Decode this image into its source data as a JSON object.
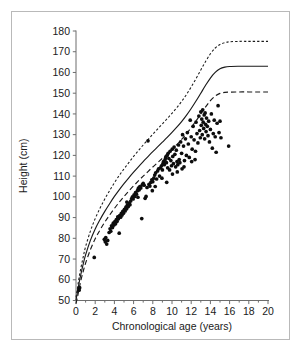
{
  "figure": {
    "border_color": "#b9b9b9",
    "background": "#ffffff"
  },
  "chart_data": {
    "type": "scatter",
    "title": "",
    "subtitle": "",
    "xlabel": "Chronological age (years)",
    "ylabel": "Height (cm)",
    "xlim": [
      0,
      20
    ],
    "ylim": [
      50,
      180
    ],
    "grid": false,
    "legend_position": "none",
    "x_ticks": [
      0,
      2,
      4,
      6,
      8,
      10,
      12,
      14,
      16,
      18,
      20
    ],
    "x_tick_labels": [
      "0",
      "2",
      "4",
      "6",
      "8",
      "10",
      "12",
      "14",
      "16",
      "18",
      "20"
    ],
    "x_minor_ticks": [
      1,
      3,
      5,
      7,
      9,
      11,
      13,
      15,
      17,
      19
    ],
    "y_ticks": [
      50,
      60,
      70,
      80,
      90,
      100,
      110,
      120,
      130,
      140,
      150,
      160,
      170,
      180
    ],
    "y_tick_labels": [
      "50",
      "60",
      "70",
      "80",
      "90",
      "100",
      "110",
      "120",
      "130",
      "140",
      "150",
      "160",
      "170",
      "180"
    ],
    "series": [
      {
        "name": "Upper reference percentile",
        "type": "line",
        "style": "dotted",
        "color": "#1a1a1a",
        "plateau": 175,
        "points": [
          [
            0.0,
            51.5
          ],
          [
            0.15,
            56.0
          ],
          [
            0.3,
            60.5
          ],
          [
            0.5,
            65.5
          ],
          [
            0.75,
            71.0
          ],
          [
            1.0,
            76.0
          ],
          [
            1.5,
            83.5
          ],
          [
            2.0,
            89.5
          ],
          [
            2.5,
            94.5
          ],
          [
            3.0,
            99.0
          ],
          [
            3.5,
            103.0
          ],
          [
            4.0,
            106.8
          ],
          [
            4.5,
            110.3
          ],
          [
            5.0,
            113.5
          ],
          [
            5.5,
            116.5
          ],
          [
            6.0,
            119.5
          ],
          [
            6.5,
            122.3
          ],
          [
            7.0,
            125.0
          ],
          [
            7.5,
            127.6
          ],
          [
            8.0,
            130.2
          ],
          [
            8.5,
            132.7
          ],
          [
            9.0,
            135.2
          ],
          [
            9.5,
            137.7
          ],
          [
            10.0,
            140.3
          ],
          [
            10.5,
            143.0
          ],
          [
            11.0,
            146.0
          ],
          [
            11.5,
            149.3
          ],
          [
            12.0,
            153.0
          ],
          [
            12.5,
            157.0
          ],
          [
            13.0,
            161.2
          ],
          [
            13.5,
            165.3
          ],
          [
            14.0,
            169.0
          ],
          [
            14.5,
            171.8
          ],
          [
            15.0,
            173.5
          ],
          [
            15.5,
            174.4
          ],
          [
            16.0,
            174.8
          ],
          [
            17.0,
            175.0
          ],
          [
            18.0,
            175.0
          ],
          [
            19.0,
            175.0
          ],
          [
            20.0,
            175.0
          ]
        ]
      },
      {
        "name": "Median reference",
        "type": "line",
        "style": "solid",
        "color": "#1a1a1a",
        "plateau": 163,
        "points": [
          [
            0.0,
            50.2
          ],
          [
            0.15,
            54.0
          ],
          [
            0.3,
            58.0
          ],
          [
            0.5,
            62.5
          ],
          [
            0.75,
            67.5
          ],
          [
            1.0,
            72.0
          ],
          [
            1.5,
            79.0
          ],
          [
            2.0,
            84.5
          ],
          [
            2.5,
            89.0
          ],
          [
            3.0,
            93.0
          ],
          [
            3.5,
            96.7
          ],
          [
            4.0,
            100.2
          ],
          [
            4.5,
            103.4
          ],
          [
            5.0,
            106.4
          ],
          [
            5.5,
            109.2
          ],
          [
            6.0,
            111.9
          ],
          [
            6.5,
            114.5
          ],
          [
            7.0,
            117.0
          ],
          [
            7.5,
            119.4
          ],
          [
            8.0,
            121.8
          ],
          [
            8.5,
            124.1
          ],
          [
            9.0,
            126.4
          ],
          [
            9.5,
            128.7
          ],
          [
            10.0,
            131.1
          ],
          [
            10.5,
            133.6
          ],
          [
            11.0,
            136.3
          ],
          [
            11.5,
            139.3
          ],
          [
            12.0,
            142.6
          ],
          [
            12.5,
            146.2
          ],
          [
            13.0,
            150.0
          ],
          [
            13.5,
            153.8
          ],
          [
            14.0,
            157.3
          ],
          [
            14.5,
            160.0
          ],
          [
            15.0,
            161.8
          ],
          [
            15.5,
            162.6
          ],
          [
            16.0,
            162.9
          ],
          [
            17.0,
            163.0
          ],
          [
            18.0,
            163.0
          ],
          [
            19.0,
            163.0
          ],
          [
            20.0,
            163.0
          ]
        ]
      },
      {
        "name": "Lower reference percentile",
        "type": "line",
        "style": "dashed",
        "color": "#1a1a1a",
        "plateau": 150.5,
        "points": [
          [
            0.0,
            48.5
          ],
          [
            0.15,
            51.5
          ],
          [
            0.3,
            55.0
          ],
          [
            0.5,
            59.5
          ],
          [
            0.75,
            64.0
          ],
          [
            1.0,
            68.0
          ],
          [
            1.5,
            74.5
          ],
          [
            2.0,
            79.8
          ],
          [
            2.5,
            84.0
          ],
          [
            3.0,
            87.8
          ],
          [
            3.5,
            91.2
          ],
          [
            4.0,
            94.4
          ],
          [
            4.5,
            97.4
          ],
          [
            5.0,
            100.2
          ],
          [
            5.5,
            102.8
          ],
          [
            6.0,
            105.3
          ],
          [
            6.5,
            107.7
          ],
          [
            7.0,
            110.0
          ],
          [
            7.5,
            112.2
          ],
          [
            8.0,
            114.4
          ],
          [
            8.5,
            116.5
          ],
          [
            9.0,
            118.6
          ],
          [
            9.5,
            120.7
          ],
          [
            10.0,
            122.9
          ],
          [
            10.5,
            125.2
          ],
          [
            11.0,
            127.7
          ],
          [
            11.5,
            130.4
          ],
          [
            12.0,
            133.4
          ],
          [
            12.5,
            136.6
          ],
          [
            13.0,
            140.0
          ],
          [
            13.5,
            143.4
          ],
          [
            14.0,
            146.4
          ],
          [
            14.5,
            148.6
          ],
          [
            15.0,
            149.9
          ],
          [
            15.5,
            150.4
          ],
          [
            16.0,
            150.5
          ],
          [
            17.0,
            150.6
          ],
          [
            18.0,
            150.6
          ],
          [
            19.0,
            150.6
          ],
          [
            20.0,
            150.6
          ]
        ]
      },
      {
        "name": "Patient measurements",
        "type": "scatter",
        "marker": "filled-circle",
        "color": "#0d0d0d",
        "points": [
          [
            0.3,
            55.5
          ],
          [
            0.38,
            56.2
          ],
          [
            0.32,
            55.0
          ],
          [
            1.9,
            70.8
          ],
          [
            2.95,
            79.5
          ],
          [
            3.05,
            78.3
          ],
          [
            3.1,
            80.4
          ],
          [
            3.2,
            77.2
          ],
          [
            3.3,
            79.0
          ],
          [
            3.45,
            82.8
          ],
          [
            3.55,
            84.6
          ],
          [
            3.62,
            83.4
          ],
          [
            3.7,
            86.0
          ],
          [
            3.8,
            85.2
          ],
          [
            3.88,
            87.3
          ],
          [
            3.95,
            86.4
          ],
          [
            4.05,
            88.1
          ],
          [
            4.12,
            87.0
          ],
          [
            4.2,
            89.0
          ],
          [
            4.28,
            88.2
          ],
          [
            4.35,
            90.3
          ],
          [
            4.42,
            89.4
          ],
          [
            4.5,
            82.5
          ],
          [
            4.55,
            91.0
          ],
          [
            4.65,
            90.2
          ],
          [
            4.72,
            92.0
          ],
          [
            4.8,
            91.2
          ],
          [
            4.88,
            93.0
          ],
          [
            4.95,
            92.1
          ],
          [
            5.05,
            94.0
          ],
          [
            5.12,
            93.2
          ],
          [
            5.2,
            95.0
          ],
          [
            5.28,
            94.2
          ],
          [
            5.35,
            96.0
          ],
          [
            5.45,
            95.3
          ],
          [
            5.55,
            97.0
          ],
          [
            5.62,
            96.2
          ],
          [
            5.7,
            98.0
          ],
          [
            5.8,
            99.2
          ],
          [
            5.88,
            100.0
          ],
          [
            5.95,
            99.0
          ],
          [
            6.05,
            101.0
          ],
          [
            6.12,
            100.2
          ],
          [
            6.2,
            102.0
          ],
          [
            6.3,
            101.3
          ],
          [
            6.4,
            103.0
          ],
          [
            6.5,
            104.2
          ],
          [
            6.58,
            103.4
          ],
          [
            6.65,
            105.0
          ],
          [
            6.75,
            104.3
          ],
          [
            6.85,
            89.5
          ],
          [
            6.9,
            105.8
          ],
          [
            7.0,
            106.5
          ],
          [
            7.1,
            105.6
          ],
          [
            7.2,
            99.3
          ],
          [
            7.3,
            100.2
          ],
          [
            7.4,
            104.5
          ],
          [
            7.5,
            127.0
          ],
          [
            7.6,
            106.0
          ],
          [
            7.7,
            105.2
          ],
          [
            7.8,
            107.0
          ],
          [
            7.9,
            108.2
          ],
          [
            8.0,
            107.3
          ],
          [
            8.1,
            109.0
          ],
          [
            8.2,
            110.5
          ],
          [
            8.3,
            111.6
          ],
          [
            8.4,
            108.6
          ],
          [
            8.5,
            112.5
          ],
          [
            8.6,
            113.5
          ],
          [
            8.7,
            110.0
          ],
          [
            8.8,
            114.0
          ],
          [
            8.9,
            115.0
          ],
          [
            9.0,
            113.0
          ],
          [
            9.05,
            116.0
          ],
          [
            9.12,
            117.0
          ],
          [
            9.2,
            115.5
          ],
          [
            9.28,
            118.0
          ],
          [
            9.35,
            119.0
          ],
          [
            9.42,
            116.5
          ],
          [
            9.5,
            120.0
          ],
          [
            9.55,
            114.0
          ],
          [
            9.6,
            121.0
          ],
          [
            9.68,
            118.5
          ],
          [
            9.75,
            113.0
          ],
          [
            9.8,
            122.0
          ],
          [
            9.88,
            117.5
          ],
          [
            9.95,
            115.0
          ],
          [
            10.02,
            123.0
          ],
          [
            10.08,
            119.5
          ],
          [
            10.15,
            116.0
          ],
          [
            10.22,
            124.0
          ],
          [
            10.3,
            120.5
          ],
          [
            10.38,
            114.5
          ],
          [
            10.45,
            122.5
          ],
          [
            10.52,
            117.0
          ],
          [
            10.6,
            115.5
          ],
          [
            10.68,
            125.0
          ],
          [
            10.75,
            118.0
          ],
          [
            10.82,
            116.5
          ],
          [
            10.9,
            126.5
          ],
          [
            11.0,
            121.0
          ],
          [
            11.1,
            130.0
          ],
          [
            11.2,
            124.5
          ],
          [
            11.3,
            117.5
          ],
          [
            11.4,
            128.0
          ],
          [
            11.5,
            120.0
          ],
          [
            11.6,
            131.0
          ],
          [
            11.7,
            125.5
          ],
          [
            11.8,
            119.0
          ],
          [
            11.9,
            137.0
          ],
          [
            12.0,
            129.0
          ],
          [
            12.1,
            123.0
          ],
          [
            12.2,
            134.0
          ],
          [
            12.3,
            127.5
          ],
          [
            12.4,
            118.0
          ],
          [
            12.5,
            136.0
          ],
          [
            12.6,
            130.5
          ],
          [
            12.7,
            126.0
          ],
          [
            12.8,
            139.0
          ],
          [
            12.88,
            132.0
          ],
          [
            12.95,
            128.5
          ],
          [
            13.0,
            141.0
          ],
          [
            13.05,
            134.5
          ],
          [
            13.1,
            137.5
          ],
          [
            13.15,
            130.0
          ],
          [
            13.2,
            142.0
          ],
          [
            13.25,
            136.0
          ],
          [
            13.3,
            133.0
          ],
          [
            13.35,
            139.5
          ],
          [
            13.4,
            128.0
          ],
          [
            13.45,
            140.5
          ],
          [
            13.5,
            135.0
          ],
          [
            13.55,
            131.5
          ],
          [
            13.6,
            138.0
          ],
          [
            13.68,
            134.0
          ],
          [
            13.75,
            129.5
          ],
          [
            13.82,
            136.5
          ],
          [
            13.9,
            126.5
          ],
          [
            14.0,
            132.5
          ],
          [
            14.1,
            140.0
          ],
          [
            14.2,
            123.5
          ],
          [
            14.3,
            130.5
          ],
          [
            14.4,
            137.0
          ],
          [
            14.5,
            129.0
          ],
          [
            14.6,
            121.5
          ],
          [
            14.7,
            135.5
          ],
          [
            14.8,
            144.0
          ],
          [
            14.9,
            131.0
          ],
          [
            15.0,
            136.5
          ],
          [
            15.1,
            128.5
          ],
          [
            15.9,
            124.5
          ],
          [
            11.05,
            113.5
          ],
          [
            11.25,
            114.5
          ],
          [
            12.05,
            117.0
          ],
          [
            12.45,
            122.0
          ],
          [
            9.45,
            107.0
          ],
          [
            8.95,
            109.0
          ],
          [
            10.05,
            111.0
          ],
          [
            10.55,
            112.0
          ],
          [
            7.95,
            103.0
          ],
          [
            8.25,
            105.0
          ],
          [
            6.45,
            99.8
          ],
          [
            5.3,
            97.5
          ]
        ]
      }
    ]
  },
  "axis": {
    "x_label": "Chronological age (years)",
    "y_label": "Height (cm)"
  }
}
